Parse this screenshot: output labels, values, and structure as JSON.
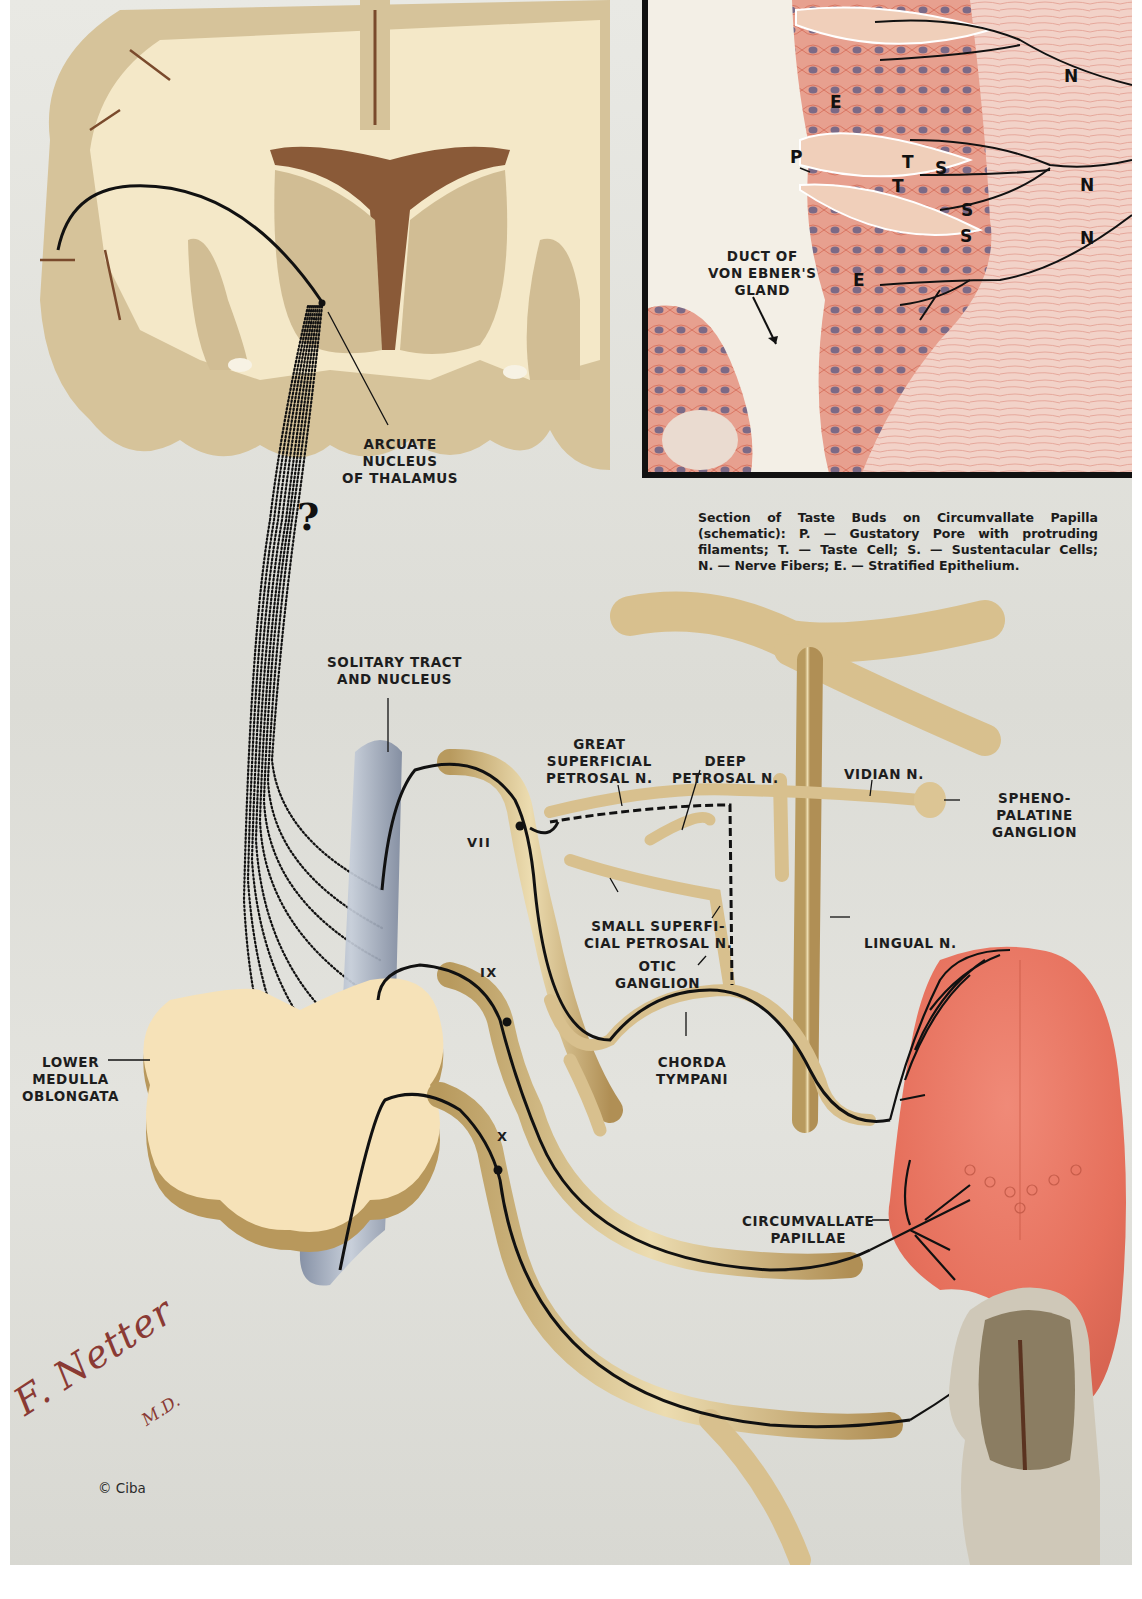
{
  "figure": {
    "colors": {
      "background": "#e2e2dc",
      "brain_white_matter": "#f4e8c8",
      "brain_gray_matter": "#d6c39a",
      "brain_dark": "#7a4a2c",
      "nerve_tan": "#d8c08e",
      "nerve_fiber": "#111111",
      "solitary_nucleus": "#9fa9bb",
      "medulla": "#f6e2b8",
      "tongue": "#e8735e",
      "histology_pink": "#e9a596",
      "histology_nuclei": "#7c6a86",
      "signature": "#8a3a34",
      "inset_border": "#111111"
    }
  },
  "brain_section": {
    "labels": {
      "arcuate_nucleus": [
        "ARCUATE",
        "NUCLEUS",
        "OF THALAMUS"
      ],
      "uncertain_pathway_mark": "?"
    }
  },
  "inset": {
    "letters": {
      "pore": "P",
      "taste_cell_1": "T",
      "taste_cell_2": "T",
      "sustentacular_1": "S",
      "sustentacular_2": "S",
      "sustentacular_3": "S",
      "epithelium_1": "E",
      "epithelium_2": "E",
      "nerve_1": "N",
      "nerve_2": "N",
      "nerve_3": "N"
    },
    "duct_label": [
      "DUCT OF",
      "VON EBNER'S",
      "GLAND"
    ],
    "caption": [
      "Section of Taste Buds on Circumvallate Papilla",
      "(schematic): P. — Gustatory Pore with protruding",
      "filaments; T. — Taste Cell; S. — Sustentacular Cells;",
      "N. — Nerve Fibers; E. — Stratified Epithelium."
    ]
  },
  "pathway_labels": {
    "solitary_tract": [
      "SOLITARY TRACT",
      "AND NUCLEUS"
    ],
    "great_superficial_petrosal": [
      "GREAT",
      "SUPERFICIAL",
      "PETROSAL N."
    ],
    "deep_petrosal": [
      "DEEP",
      "PETROSAL N."
    ],
    "vidian": "VIDIAN N.",
    "sphenopalatine": [
      "SPHENO-",
      "PALATINE",
      "GANGLION"
    ],
    "cranial_vii": "VII",
    "cranial_ix": "IX",
    "cranial_x": "X",
    "small_superficial_petrosal": [
      "SMALL SUPERFI-",
      "CIAL PETROSAL N."
    ],
    "otic_ganglion": [
      "OTIC",
      "GANGLION"
    ],
    "lingual": "LINGUAL N.",
    "chorda_tympani": [
      "CHORDA",
      "TYMPANI"
    ],
    "lower_medulla": [
      "LOWER",
      "MEDULLA",
      "OBLONGATA"
    ],
    "circumvallate_papillae": [
      "CIRCUMVALLATE",
      "PAPILLAE"
    ]
  },
  "credits": {
    "signature": "F. Netter",
    "signature_suffix": "M.D.",
    "copyright": "© Ciba"
  }
}
